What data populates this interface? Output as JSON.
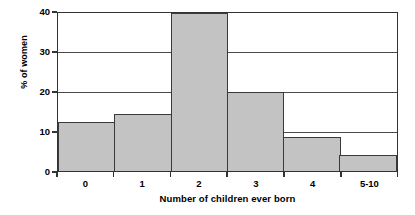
{
  "chart_data": {
    "type": "bar",
    "title": "",
    "subtitle": "",
    "xlabel": "Number of children ever born",
    "ylabel": "% of women",
    "categories": [
      "0",
      "1",
      "2",
      "3",
      "4",
      "5-10"
    ],
    "values": [
      12.5,
      14.5,
      40,
      20,
      8.5,
      4
    ],
    "series": [
      {
        "name": "% of women",
        "values": [
          12.5,
          14.5,
          40,
          20,
          8.5,
          4
        ]
      }
    ],
    "ylim": [
      0,
      40
    ],
    "ytick_labels": [
      "0",
      "10",
      "20",
      "30",
      "40"
    ],
    "ytick_values": [
      0,
      10,
      20,
      30,
      40
    ],
    "grid": true,
    "legend": false,
    "legend_position": "none",
    "bar_fill_color": "#c3c3c3",
    "bar_edge_color": "#3a3a3a",
    "axis_color": "#333333",
    "background_color": "#ffffff"
  }
}
